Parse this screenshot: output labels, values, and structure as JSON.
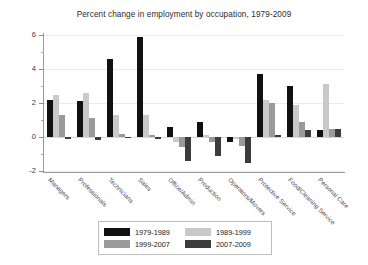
{
  "chart_data": {
    "type": "bar",
    "title": "Percent change in employment by occupation, 1979-2009",
    "xlabel": "",
    "ylabel": "",
    "ylim": [
      -2,
      6
    ],
    "yticks": [
      -2,
      0,
      2,
      4,
      6
    ],
    "ytick_labels": [
      "-2",
      "0",
      "2",
      "4",
      "6"
    ],
    "grid": true,
    "legend_position": "below-plot",
    "categories": [
      "Managers",
      "Professionals",
      "Technicians",
      "Sales",
      "Office/Admin",
      "Production",
      "Operators/Movers",
      "Protective Service",
      "Food/Cleaning Service",
      "Personal Care"
    ],
    "series": [
      {
        "name": "1979-1989",
        "color": "#111111",
        "values": [
          2.2,
          2.1,
          4.6,
          5.9,
          0.6,
          0.9,
          -0.3,
          3.7,
          3.0,
          0.4
        ]
      },
      {
        "name": "1989-1999",
        "color": "#c9c9c9",
        "values": [
          2.5,
          2.6,
          1.3,
          1.3,
          -0.3,
          0.1,
          -0.1,
          2.2,
          1.9,
          3.1
        ]
      },
      {
        "name": "1999-2007",
        "color": "#9a9a9a",
        "values": [
          1.3,
          1.1,
          0.2,
          0.1,
          -0.6,
          -0.3,
          -0.5,
          2.0,
          0.9,
          0.5
        ]
      },
      {
        "name": "2007-2009",
        "color": "#3c3c3c",
        "values": [
          -0.1,
          -0.2,
          0.0,
          -0.1,
          -1.4,
          -1.1,
          -1.5,
          0.1,
          0.4,
          0.5
        ]
      }
    ]
  },
  "legend": {
    "items": [
      {
        "label": "1979-1989",
        "color": "#111111"
      },
      {
        "label": "1989-1999",
        "color": "#c9c9c9"
      },
      {
        "label": "1999-2007",
        "color": "#9a9a9a"
      },
      {
        "label": "2007-2009",
        "color": "#3c3c3c"
      }
    ]
  }
}
